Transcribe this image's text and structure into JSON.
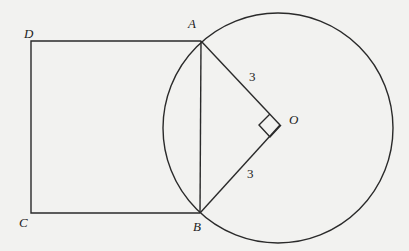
{
  "figure": {
    "points": {
      "A": "A",
      "B": "B",
      "C": "C",
      "D": "D",
      "O": "O"
    },
    "segment_labels": {
      "OA": "3",
      "OB": "3"
    },
    "right_angle_at": "O"
  }
}
